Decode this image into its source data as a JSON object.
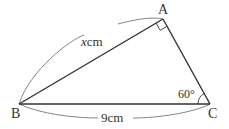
{
  "diagram": {
    "type": "right-triangle",
    "vertices": [
      {
        "name": "A",
        "x": 163,
        "y": 19
      },
      {
        "name": "B",
        "x": 19,
        "y": 104
      },
      {
        "name": "C",
        "x": 210,
        "y": 104
      }
    ],
    "labels": {
      "A": "A",
      "B": "B",
      "C": "C",
      "ab_var": "x",
      "ab_unit": "cm",
      "bc": "9cm",
      "angle_c": "60°"
    },
    "right_angle_at": "A",
    "colors": {
      "stroke": "#333333",
      "brace": "#666666",
      "text": "#333333"
    }
  }
}
